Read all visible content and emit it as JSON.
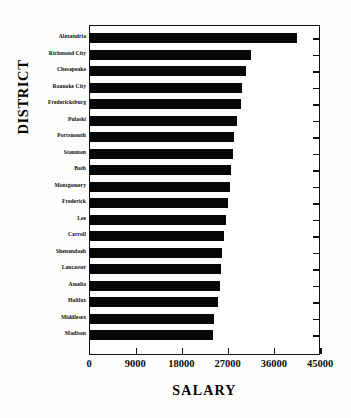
{
  "chart_data": {
    "type": "bar",
    "orientation": "horizontal",
    "title": "",
    "xlabel": "SALARY",
    "ylabel": "DISTRICT",
    "xlim": [
      0,
      45000
    ],
    "ylim": null,
    "grid": false,
    "legend": null,
    "xticks": [
      "0",
      "9000",
      "18000",
      "27000",
      "36000",
      "45000"
    ],
    "xtick_values": [
      0,
      9000,
      18000,
      27000,
      36000,
      45000
    ],
    "categories": [
      "Alexandria",
      "Richmond City",
      "Chesapeake",
      "Roanoke City",
      "Fredericksburg",
      "Pulaski",
      "Portsmouth",
      "Staunton",
      "Bath",
      "Montgomery",
      "Frederick",
      "Lee",
      "Carroll",
      "Shenandoah",
      "Lancaster",
      "Amelia",
      "Halifax",
      "Middlesex",
      "Madison"
    ],
    "values": [
      40300,
      31300,
      30300,
      29600,
      29500,
      28700,
      28100,
      27800,
      27400,
      27200,
      26800,
      26500,
      26200,
      25800,
      25600,
      25300,
      24900,
      24200,
      24000
    ],
    "bar_color": "#070707",
    "axis_color": "#111111",
    "background_color": "#ffffff"
  }
}
